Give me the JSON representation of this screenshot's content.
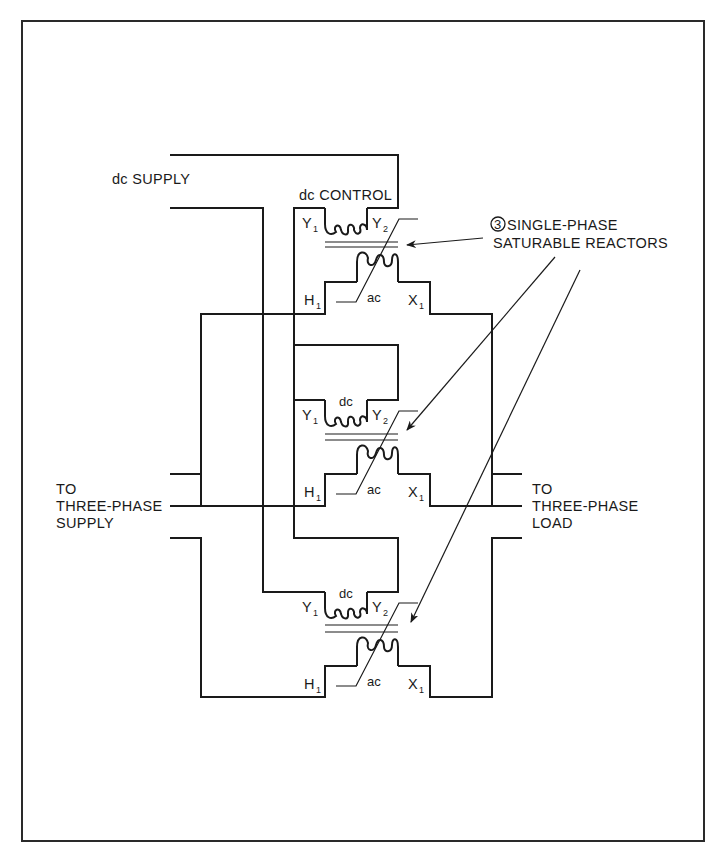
{
  "diagram": {
    "title_labels": {
      "dc_supply": "dc SUPPLY",
      "dc_control": "dc CONTROL",
      "reactors_line1": "SINGLE-PHASE",
      "reactors_line2": "SATURABLE REACTORS",
      "reactors_count": "3",
      "supply_line1": "TO",
      "supply_line2": "THREE-PHASE",
      "supply_line3": "SUPPLY",
      "load_line1": "TO",
      "load_line2": "THREE-PHASE",
      "load_line3": "LOAD"
    },
    "reactors": [
      {
        "id": 1,
        "dc_label": "",
        "ac_label": "ac",
        "terminals": {
          "y1": "Y",
          "y1_sub": "1",
          "y2": "Y",
          "y2_sub": "2",
          "h1": "H",
          "h1_sub": "1",
          "x1": "X",
          "x1_sub": "1"
        }
      },
      {
        "id": 2,
        "dc_label": "dc",
        "ac_label": "ac",
        "terminals": {
          "y1": "Y",
          "y1_sub": "1",
          "y2": "Y",
          "y2_sub": "2",
          "h1": "H",
          "h1_sub": "1",
          "x1": "X",
          "x1_sub": "1"
        }
      },
      {
        "id": 3,
        "dc_label": "dc",
        "ac_label": "ac",
        "terminals": {
          "y1": "Y",
          "y1_sub": "1",
          "y2": "Y",
          "y2_sub": "2",
          "h1": "H",
          "h1_sub": "1",
          "x1": "X",
          "x1_sub": "1"
        }
      }
    ],
    "colors": {
      "ink": "#1a1a1a",
      "background": "#ffffff"
    }
  }
}
